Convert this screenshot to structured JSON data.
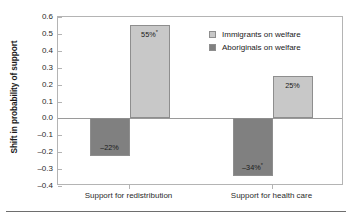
{
  "chart_data": {
    "type": "bar",
    "title": "",
    "xlabel": "",
    "ylabel": "Shift in probability of support",
    "ylim": [
      -0.4,
      0.6
    ],
    "yticks": [
      "0.6",
      "0.5",
      "0.4",
      "0.3",
      "0.2",
      "0.1",
      "0.0",
      "–0.1",
      "–0.2",
      "–0.3",
      "–0.4"
    ],
    "ytick_values": [
      0.6,
      0.5,
      0.4,
      0.3,
      0.2,
      0.1,
      0.0,
      -0.1,
      -0.2,
      -0.3,
      -0.4
    ],
    "grid": false,
    "legend_position": "top-right inside plot",
    "categories": [
      "Support for redistribution",
      "Support for health care"
    ],
    "series": [
      {
        "name": "Immigrants on welfare",
        "color": "#c8c8c8",
        "values": [
          0.55,
          0.25
        ],
        "labels": [
          "55%",
          "25%"
        ],
        "significance": [
          "*",
          ""
        ]
      },
      {
        "name": "Aboriginals on welfare",
        "color": "#808080",
        "values": [
          -0.22,
          -0.34
        ],
        "labels": [
          "–22%",
          "–34%"
        ],
        "significance": [
          "",
          "*"
        ]
      }
    ],
    "annotations": {
      "significance_marker": "*"
    }
  },
  "colors": {
    "immigrants": "#c8c8c8",
    "aboriginals": "#808080",
    "bar_border": "#8e8e8e",
    "axis": "#b4b4b4",
    "zero_line": "#9a9a9a",
    "text": "#1a1a1a",
    "background": "#ffffff"
  }
}
